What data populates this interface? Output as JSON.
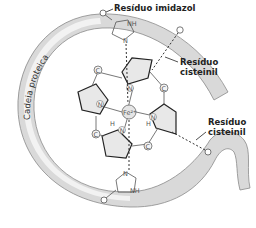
{
  "diagram": {
    "title": "",
    "labels": {
      "imidazole_residue": "Resíduo imidazol",
      "cysteinyl_residue_top_line1": "Resíduo",
      "cysteinyl_residue_top_line2": "cisteinil",
      "cysteinyl_residue_right_line1": "Resíduo",
      "cysteinyl_residue_right_line2": "cisteinil",
      "protein_chain": "Cadeia proteica"
    },
    "atoms": {
      "iron": "Fe²⁺",
      "nitrogen": "N",
      "carbon": "C",
      "hydrogen": "H",
      "nh": "NH"
    },
    "colors": {
      "chain_fill": "#d9d9d9",
      "chain_stroke": "#8a8a8a",
      "pyrrole_fill": "#e8e8e8",
      "line": "#333333",
      "text": "#222222"
    }
  }
}
